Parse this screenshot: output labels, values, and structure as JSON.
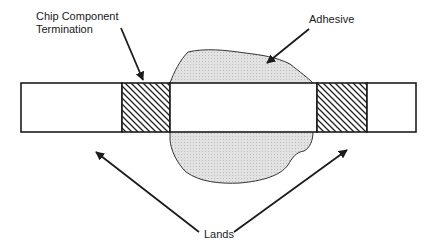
{
  "diagram": {
    "type": "cross-section",
    "colors": {
      "line": "#1c1c1c",
      "adhesive_fill": "#d9d9d9",
      "background": "#ffffff"
    },
    "labels": {
      "termination_line1": "Chip Component",
      "termination_line2": "Termination",
      "adhesive": "Adhesive",
      "lands": "Lands"
    },
    "components": [
      {
        "name": "left-land",
        "label": "Lands"
      },
      {
        "name": "left-termination",
        "label": "Chip Component Termination"
      },
      {
        "name": "chip-body"
      },
      {
        "name": "right-termination"
      },
      {
        "name": "right-land",
        "label": "Lands"
      },
      {
        "name": "adhesive",
        "label": "Adhesive"
      }
    ]
  }
}
